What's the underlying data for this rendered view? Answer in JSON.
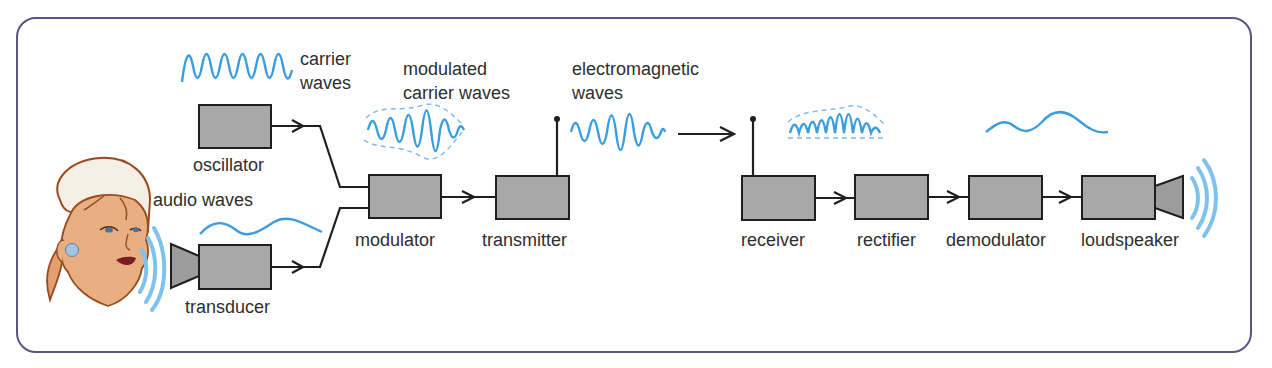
{
  "diagram": {
    "colors": {
      "frame": "#5a5683",
      "box_fill": "#a8a8a8",
      "box_stroke": "#1f1f1f",
      "wave": "#3a9ede",
      "text": "#2e2e2e"
    },
    "wave_labels": {
      "carrier": [
        "carrier",
        "waves"
      ],
      "modulated": [
        "modulated",
        "carrier waves"
      ],
      "electromagnetic": [
        "electromagnetic",
        "waves"
      ],
      "audio": "audio waves"
    },
    "blocks": [
      {
        "id": "oscillator",
        "label": "oscillator"
      },
      {
        "id": "transducer",
        "label": "transducer"
      },
      {
        "id": "modulator",
        "label": "modulator"
      },
      {
        "id": "transmitter",
        "label": "transmitter"
      },
      {
        "id": "receiver",
        "label": "receiver"
      },
      {
        "id": "rectifier",
        "label": "rectifier"
      },
      {
        "id": "demodulator",
        "label": "demodulator"
      },
      {
        "id": "loudspeaker",
        "label": "loudspeaker"
      }
    ],
    "connections": [
      [
        "oscillator",
        "modulator"
      ],
      [
        "transducer",
        "modulator"
      ],
      [
        "modulator",
        "transmitter"
      ],
      [
        "transmitter",
        "receiver"
      ],
      [
        "receiver",
        "rectifier"
      ],
      [
        "rectifier",
        "demodulator"
      ],
      [
        "demodulator",
        "loudspeaker"
      ]
    ]
  }
}
